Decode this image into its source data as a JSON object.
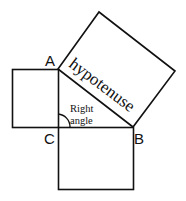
{
  "diagram": {
    "vertices": {
      "A": {
        "label": "A"
      },
      "B": {
        "label": "B"
      },
      "C": {
        "label": "C"
      }
    },
    "hypotenuse_label": "hypotenuse",
    "angle_label_line1": "Right",
    "angle_label_line2": "angle",
    "stroke_color": "#111111",
    "background": "#ffffff"
  }
}
